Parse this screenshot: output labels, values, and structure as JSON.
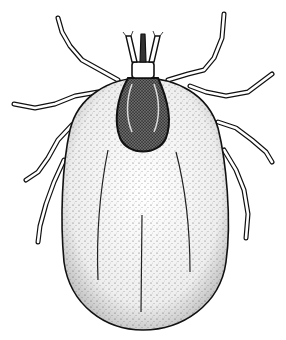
{
  "image": {
    "subject": "tick",
    "style": "black-and-white stippled scientific illustration",
    "view": "dorsal",
    "width": 286,
    "height": 340,
    "colors": {
      "background": "#ffffff",
      "ink": "#111111",
      "body_fill": "#f2f2f2",
      "scutum_fill": "#555555"
    },
    "parts": [
      "capitulum",
      "palps",
      "scutum",
      "idiosoma",
      "legs"
    ],
    "leg_count": 8
  }
}
